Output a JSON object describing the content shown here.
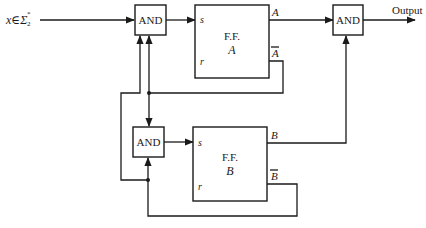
{
  "diagram": {
    "input_label": "x∈Σ",
    "input_sup": "*",
    "input_sub": "2",
    "output_label": "Output",
    "gates": {
      "and_top": "AND",
      "and_bottom": "AND",
      "and_output": "AND"
    },
    "flipflops": {
      "ffa": {
        "title": "F.F.",
        "name": "A",
        "set": "s",
        "reset": "r",
        "q": "A",
        "qbar": "A"
      },
      "ffb": {
        "title": "F.F.",
        "name": "B",
        "set": "s",
        "reset": "r",
        "q": "B",
        "qbar": "B"
      }
    },
    "colors": {
      "line": "#1a1a1a",
      "background": "#ffffff"
    }
  }
}
